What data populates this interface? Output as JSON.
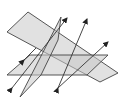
{
  "diagram": {
    "colors": {
      "background": "#ffffff",
      "plane_fill": "#c8c8c8",
      "edge": "#444444",
      "arrow": "#222222"
    },
    "planes": [
      {
        "name": "tilted-plane",
        "points": [
          [
            28,
            12
          ],
          [
            7,
            32
          ],
          [
            96,
            93
          ],
          [
            118,
            73
          ]
        ]
      },
      {
        "name": "horizontal-plane",
        "points": [
          [
            7,
            75
          ],
          [
            87,
            75
          ],
          [
            108,
            55
          ],
          [
            30,
            55
          ]
        ]
      },
      {
        "name": "vertical-plane",
        "points": [
          [
            62,
            17
          ],
          [
            20,
            97
          ],
          [
            40,
            77
          ],
          [
            59,
            45
          ]
        ]
      }
    ],
    "lines": [
      {
        "name": "line-1",
        "from": [
          12,
          88
        ],
        "to": [
          66,
          18
        ]
      },
      {
        "name": "line-2",
        "from": [
          58,
          88
        ],
        "to": [
          87,
          18
        ]
      },
      {
        "name": "line-3",
        "from": [
          25,
          60
        ],
        "to": [
          108,
          42
        ]
      }
    ]
  }
}
